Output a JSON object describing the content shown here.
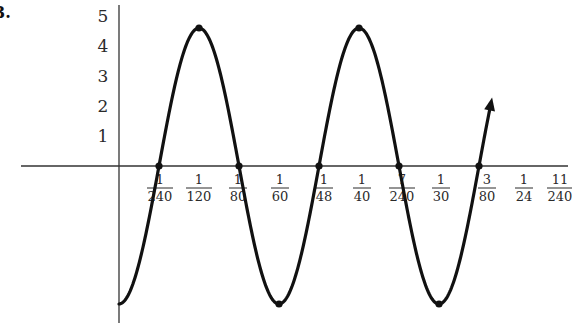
{
  "problem_label": "3.",
  "chart_data": {
    "type": "line",
    "title": "",
    "xlabel": "",
    "ylabel": "",
    "function_description": "y = -4.6 cos(120πt), sinusoid with period 1/60",
    "amplitude": 4.6,
    "period": "1/60",
    "x_range": [
      0,
      0.0375
    ],
    "ylim": [
      -5,
      5
    ],
    "grid": false,
    "y_ticks": [
      "1",
      "2",
      "3",
      "4",
      "5"
    ],
    "x_ticks": [
      {
        "num": "1",
        "den": "240",
        "value": 0.0041667
      },
      {
        "num": "1",
        "den": "120",
        "value": 0.0083333
      },
      {
        "num": "1",
        "den": "80",
        "value": 0.0125
      },
      {
        "num": "1",
        "den": "60",
        "value": 0.0166667
      },
      {
        "num": "1",
        "den": "48",
        "value": 0.0208333
      },
      {
        "num": "1",
        "den": "40",
        "value": 0.025
      },
      {
        "num": "7",
        "den": "240",
        "value": 0.0291667
      },
      {
        "num": "1",
        "den": "30",
        "value": 0.0333333
      },
      {
        "num": "3",
        "den": "80",
        "value": 0.0375
      },
      {
        "num": "1",
        "den": "24",
        "value": 0.0416667
      },
      {
        "num": "11",
        "den": "240",
        "value": 0.0458333
      }
    ],
    "marked_points": [
      {
        "x": "0",
        "y": -4.6
      },
      {
        "x": "1/240",
        "y": 0
      },
      {
        "x": "1/120",
        "y": 4.6
      },
      {
        "x": "1/80",
        "y": 0
      },
      {
        "x": "1/60",
        "y": -4.6
      },
      {
        "x": "1/48",
        "y": 0
      },
      {
        "x": "1/40",
        "y": 4.6
      },
      {
        "x": "7/240",
        "y": 0
      },
      {
        "x": "1/30",
        "y": -4.6
      },
      {
        "x": "3/80",
        "y": 0
      }
    ],
    "end_arrow": true
  },
  "layout": {
    "origin_px": [
      119,
      166
    ],
    "px_per_240th": 40,
    "px_per_unit_y": 30,
    "label_x_px": [
      160,
      199,
      238,
      280,
      324,
      362,
      402,
      441,
      487,
      524,
      560
    ]
  }
}
